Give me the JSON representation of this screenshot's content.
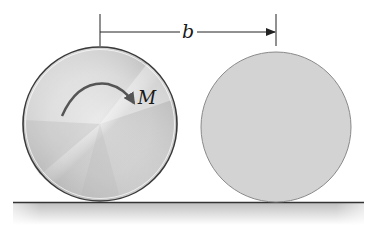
{
  "diagram": {
    "dimension": {
      "label": "b",
      "from_x": 100,
      "to_x": 276,
      "y": 32
    },
    "moment": {
      "label": "M",
      "direction": "clockwise"
    },
    "left_disk": {
      "description": "brushed metal disk with applied moment",
      "cx": 100,
      "cy": 124,
      "r": 77
    },
    "right_disk": {
      "description": "gray disk",
      "cx": 276,
      "cy": 126,
      "r": 75
    },
    "ground": {
      "y": 202,
      "x_start": 13,
      "x_end": 364
    },
    "colors": {
      "line": "#222222",
      "disk_edge": "#3a3a3a",
      "right_disk_fill": "#d2d2d2",
      "ground_fill": "#c8c8c8"
    }
  }
}
